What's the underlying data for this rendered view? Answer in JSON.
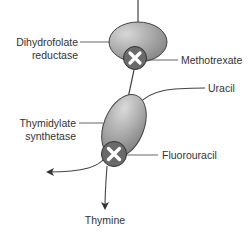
{
  "diagram": {
    "enzymes": [
      {
        "name_line1": "Dihydrofolate",
        "name_line2": "reductase",
        "inhibitor": "Methotrexate"
      },
      {
        "name_line1": "Thymidylate",
        "name_line2": "synthetase",
        "inhibitor": "Fluorouracil"
      }
    ],
    "substrate": "Uracil",
    "product": "Thymine",
    "inhibition_symbol": "inhibit-x-icon",
    "colors": {
      "enzyme_light": "#d8d8d8",
      "enzyme_dark": "#7a7a7a",
      "inhibitor_circle": "#6a6a6a",
      "line": "#444444",
      "text": "#333333"
    }
  }
}
